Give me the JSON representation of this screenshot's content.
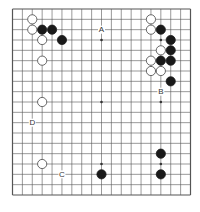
{
  "board": {
    "size": 19,
    "line_color": "#555555",
    "star_points": [
      [
        3,
        3
      ],
      [
        3,
        9
      ],
      [
        3,
        15
      ],
      [
        9,
        3
      ],
      [
        9,
        9
      ],
      [
        9,
        15
      ],
      [
        15,
        3
      ],
      [
        15,
        9
      ],
      [
        15,
        15
      ]
    ],
    "stones": [
      {
        "color": "white",
        "col": 2,
        "row": 1
      },
      {
        "color": "white",
        "col": 2,
        "row": 2
      },
      {
        "color": "black",
        "col": 3,
        "row": 2
      },
      {
        "color": "black",
        "col": 4,
        "row": 2
      },
      {
        "color": "white",
        "col": 3,
        "row": 3
      },
      {
        "color": "black",
        "col": 5,
        "row": 3
      },
      {
        "color": "white",
        "col": 3,
        "row": 5
      },
      {
        "color": "white",
        "col": 3,
        "row": 9
      },
      {
        "color": "white",
        "col": 3,
        "row": 15
      },
      {
        "color": "black",
        "col": 9,
        "row": 16
      },
      {
        "color": "white",
        "col": 14,
        "row": 1
      },
      {
        "color": "white",
        "col": 14,
        "row": 2
      },
      {
        "color": "black",
        "col": 15,
        "row": 2
      },
      {
        "color": "black",
        "col": 16,
        "row": 3
      },
      {
        "color": "white",
        "col": 15,
        "row": 4
      },
      {
        "color": "black",
        "col": 16,
        "row": 4
      },
      {
        "color": "white",
        "col": 14,
        "row": 5
      },
      {
        "color": "black",
        "col": 15,
        "row": 5
      },
      {
        "color": "black",
        "col": 16,
        "row": 5
      },
      {
        "color": "white",
        "col": 14,
        "row": 6
      },
      {
        "color": "white",
        "col": 15,
        "row": 6
      },
      {
        "color": "black",
        "col": 16,
        "row": 7
      },
      {
        "color": "black",
        "col": 15,
        "row": 14
      },
      {
        "color": "black",
        "col": 15,
        "row": 16
      }
    ],
    "labels": [
      {
        "text": "A",
        "col": 9,
        "row": 2
      },
      {
        "text": "B",
        "col": 15,
        "row": 8
      },
      {
        "text": "C",
        "col": 5,
        "row": 16
      },
      {
        "text": "D",
        "col": 2,
        "row": 11
      }
    ]
  }
}
